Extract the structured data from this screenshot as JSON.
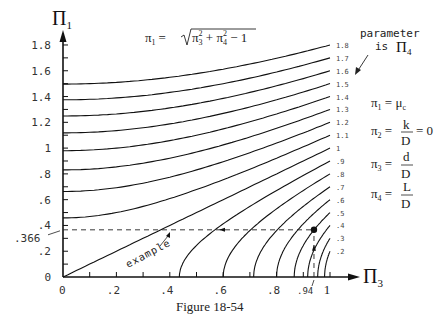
{
  "caption": "Figure 18-54",
  "equation": {
    "lhs": "π",
    "lhs_sub": "1",
    "rhs": "= √(π₃² + π₄² − 1)"
  },
  "definitions": [
    {
      "lhs": "π",
      "sub": "1",
      "rhs": "= μ",
      "rhs_sub": "c",
      "frac": null
    },
    {
      "lhs": "π",
      "sub": "2",
      "rhs_frac_num": "k",
      "rhs_frac_den": "D",
      "tail": "= 0"
    },
    {
      "lhs": "π",
      "sub": "3",
      "rhs_frac_num": "d",
      "rhs_frac_den": "D",
      "tail": ""
    },
    {
      "lhs": "π",
      "sub": "4",
      "rhs_frac_num": "L",
      "rhs_frac_den": "D",
      "tail": ""
    }
  ],
  "parameter_note": {
    "line1": "parameter",
    "line2": "is",
    "symbol": "Π",
    "symbol_sub": "4"
  },
  "example": {
    "label": "example",
    "pi3": 0.94,
    "pi1": 0.366,
    "pi3_label": ".94",
    "pi1_label": ".366"
  },
  "chart_data": {
    "type": "line",
    "title": "",
    "formula": "pi1 = sqrt(pi3^2 + pi4^2 - 1)",
    "xlabel": "Π3",
    "ylabel": "Π1",
    "xlim": [
      0,
      1
    ],
    "ylim": [
      0,
      1.8
    ],
    "x_ticks": [
      0,
      0.2,
      0.4,
      0.6,
      0.8,
      1
    ],
    "x_tick_labels": [
      "0",
      ".2",
      ".4",
      ".6",
      ".8",
      "1"
    ],
    "y_ticks": [
      0,
      0.2,
      0.4,
      0.6,
      0.8,
      1,
      1.2,
      1.4,
      1.6,
      1.8
    ],
    "y_tick_labels": [
      "0",
      ".2",
      ".4",
      ".6",
      ".8",
      "1",
      "1.2",
      "1.4",
      "1.6",
      "1.8"
    ],
    "grid": false,
    "legend": "curve labels at right end",
    "series": [
      {
        "name": "1.8",
        "pi4": 1.8
      },
      {
        "name": "1.7",
        "pi4": 1.7
      },
      {
        "name": "1.6",
        "pi4": 1.6
      },
      {
        "name": "1.5",
        "pi4": 1.5
      },
      {
        "name": "1.4",
        "pi4": 1.4
      },
      {
        "name": "1.3",
        "pi4": 1.3
      },
      {
        "name": "1.2",
        "pi4": 1.2
      },
      {
        "name": "1.1",
        "pi4": 1.1
      },
      {
        "name": "1",
        "pi4": 1.0
      },
      {
        "name": ".9",
        "pi4": 0.9
      },
      {
        "name": ".8",
        "pi4": 0.8
      },
      {
        "name": ".7",
        "pi4": 0.7
      },
      {
        "name": ".6",
        "pi4": 0.6
      },
      {
        "name": ".5",
        "pi4": 0.5
      },
      {
        "name": ".4",
        "pi4": 0.4
      },
      {
        "name": ".3",
        "pi4": 0.3
      },
      {
        "name": ".2",
        "pi4": 0.2
      }
    ],
    "annotations": [
      {
        "text": "example",
        "pi3": 0.94,
        "pi1": 0.366
      },
      {
        "text": "parameter is Π4"
      }
    ]
  }
}
